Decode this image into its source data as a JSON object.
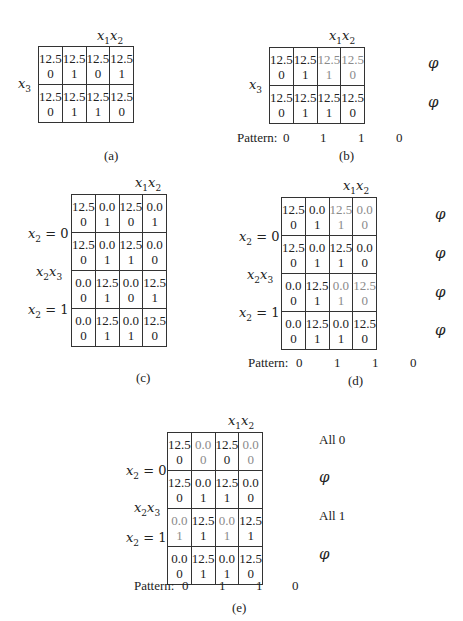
{
  "panels": {
    "a": {
      "caption": "(a)",
      "col_var": "x1x2",
      "row_var": "x3",
      "rows": [
        [
          {
            "v": "12.5",
            "b": "0"
          },
          {
            "v": "12.5",
            "b": "1"
          },
          {
            "v": "12.5",
            "b": "0"
          },
          {
            "v": "12.5",
            "b": "1"
          }
        ],
        [
          {
            "v": "12.5",
            "b": "0"
          },
          {
            "v": "12.5",
            "b": "1"
          },
          {
            "v": "12.5",
            "b": "1"
          },
          {
            "v": "12.5",
            "b": "0"
          }
        ]
      ]
    },
    "b": {
      "caption": "(b)",
      "col_var": "x1x2",
      "row_var": "x3",
      "rows": [
        [
          {
            "v": "12.5",
            "b": "0"
          },
          {
            "v": "12.5",
            "b": "1"
          },
          {
            "v": "12.5",
            "b": "1",
            "gray": true
          },
          {
            "v": "12.5",
            "b": "0",
            "gray": true
          }
        ],
        [
          {
            "v": "12.5",
            "b": "0"
          },
          {
            "v": "12.5",
            "b": "1"
          },
          {
            "v": "12.5",
            "b": "1"
          },
          {
            "v": "12.5",
            "b": "0"
          }
        ]
      ],
      "row_tags": [
        "φ",
        "φ"
      ],
      "pattern_label": "Pattern:",
      "pattern": [
        "0",
        "1",
        "1",
        "0"
      ]
    },
    "c": {
      "caption": "(c)",
      "col_var": "x1x2",
      "row_labels": [
        "x2 = 0",
        "x2x3",
        "x2 = 1"
      ],
      "rows": [
        [
          {
            "v": "12.5",
            "b": "0"
          },
          {
            "v": "0.0",
            "b": "1"
          },
          {
            "v": "12.5",
            "b": "0"
          },
          {
            "v": "0.0",
            "b": "1"
          }
        ],
        [
          {
            "v": "12.5",
            "b": "0"
          },
          {
            "v": "0.0",
            "b": "1"
          },
          {
            "v": "12.5",
            "b": "1"
          },
          {
            "v": "0.0",
            "b": "0"
          }
        ],
        [
          {
            "v": "0.0",
            "b": "0"
          },
          {
            "v": "12.5",
            "b": "1"
          },
          {
            "v": "0.0",
            "b": "0"
          },
          {
            "v": "12.5",
            "b": "1"
          }
        ],
        [
          {
            "v": "0.0",
            "b": "0"
          },
          {
            "v": "12.5",
            "b": "1"
          },
          {
            "v": "0.0",
            "b": "1"
          },
          {
            "v": "12.5",
            "b": "0"
          }
        ]
      ]
    },
    "d": {
      "caption": "(d)",
      "col_var": "x1x2",
      "row_labels": [
        "x2 = 0",
        "x2x3",
        "x2 = 1"
      ],
      "rows": [
        [
          {
            "v": "12.5",
            "b": "0"
          },
          {
            "v": "0.0",
            "b": "1"
          },
          {
            "v": "12.5",
            "b": "1",
            "gray": true
          },
          {
            "v": "0.0",
            "b": "0",
            "gray": true
          }
        ],
        [
          {
            "v": "12.5",
            "b": "0"
          },
          {
            "v": "0.0",
            "b": "1"
          },
          {
            "v": "12.5",
            "b": "1"
          },
          {
            "v": "0.0",
            "b": "0"
          }
        ],
        [
          {
            "v": "0.0",
            "b": "0"
          },
          {
            "v": "12.5",
            "b": "1"
          },
          {
            "v": "0.0",
            "b": "1",
            "gray": true
          },
          {
            "v": "12.5",
            "b": "0",
            "gray": true
          }
        ],
        [
          {
            "v": "0.0",
            "b": "0"
          },
          {
            "v": "12.5",
            "b": "1"
          },
          {
            "v": "0.0",
            "b": "1"
          },
          {
            "v": "12.5",
            "b": "0"
          }
        ]
      ],
      "row_tags": [
        "φ",
        "φ",
        "φ",
        "φ"
      ],
      "pattern_label": "Pattern:",
      "pattern": [
        "0",
        "1",
        "1",
        "0"
      ]
    },
    "e": {
      "caption": "(e)",
      "col_var": "x1x2",
      "row_labels": [
        "x2 = 0",
        "x2x3",
        "x2 = 1"
      ],
      "rows": [
        [
          {
            "v": "12.5",
            "b": "0"
          },
          {
            "v": "0.0",
            "b": "0",
            "gray": true
          },
          {
            "v": "12.5",
            "b": "0"
          },
          {
            "v": "0.0",
            "b": "0",
            "gray": true
          }
        ],
        [
          {
            "v": "12.5",
            "b": "0"
          },
          {
            "v": "0.0",
            "b": "1"
          },
          {
            "v": "12.5",
            "b": "1"
          },
          {
            "v": "0.0",
            "b": "0"
          }
        ],
        [
          {
            "v": "0.0",
            "b": "1",
            "gray": true
          },
          {
            "v": "12.5",
            "b": "1"
          },
          {
            "v": "0.0",
            "b": "1",
            "gray": true
          },
          {
            "v": "12.5",
            "b": "1"
          }
        ],
        [
          {
            "v": "0.0",
            "b": "0"
          },
          {
            "v": "12.5",
            "b": "1"
          },
          {
            "v": "0.0",
            "b": "1"
          },
          {
            "v": "12.5",
            "b": "0"
          }
        ]
      ],
      "row_tags": [
        "All 0",
        "φ",
        "All 1",
        "φ"
      ],
      "pattern_label": "Pattern:",
      "pattern": [
        "0",
        "1",
        "1",
        "0"
      ]
    }
  }
}
